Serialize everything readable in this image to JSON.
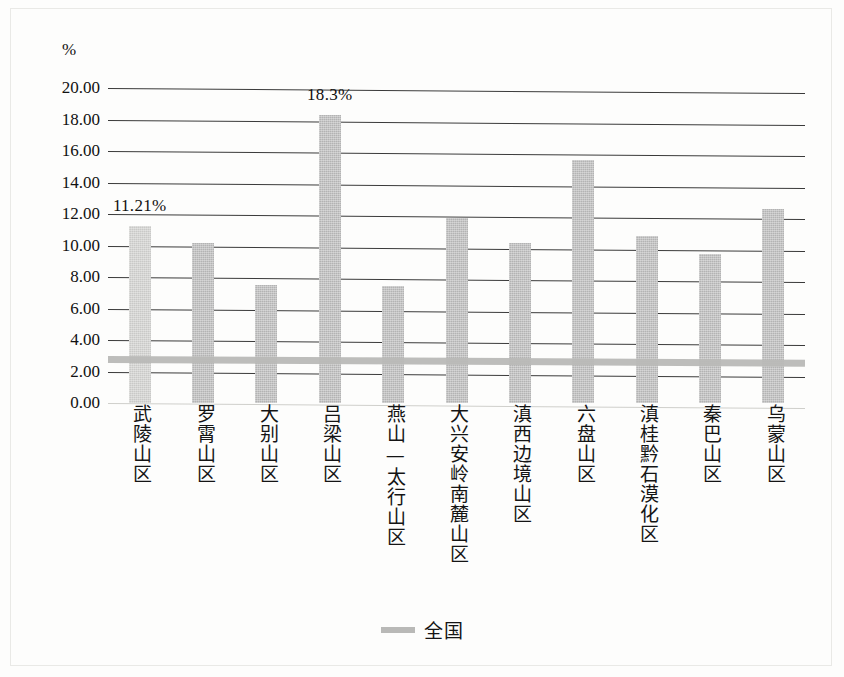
{
  "axis": {
    "unit_label": "%",
    "y_ticks": [
      "20.00",
      "18.00",
      "16.00",
      "14.00",
      "12.00",
      "10.00",
      "8.00",
      "6.00",
      "4.00",
      "2.00",
      "0.00"
    ]
  },
  "legend": {
    "series_label": "全国",
    "swatch": "national-average-line-swatch"
  },
  "annotations": {
    "first_bar_label": "11.21%",
    "tallest_bar_label": "18.3%"
  },
  "colors": {
    "bar_fill": "#b3b3b3",
    "bar_fill_first": "#c9c9c7",
    "gridline": "#3a3a3a",
    "average_line": "#b9b9b7",
    "text": "#111111"
  },
  "chart_data": {
    "type": "bar",
    "title": "",
    "subtitle": "",
    "xlabel": "",
    "ylabel": "%",
    "ylim": [
      0,
      20
    ],
    "ytick_step": 2,
    "grid": true,
    "legend_position": "bottom-center",
    "categories": [
      "武陵山区",
      "罗霄山区",
      "大别山区",
      "吕梁山区",
      "燕山—太行山区",
      "大兴安岭南麓山区",
      "滇西边境山区",
      "六盘山区",
      "滇桂黔石漠化区",
      "秦巴山区",
      "乌蒙山区"
    ],
    "values": [
      11.21,
      10.15,
      7.5,
      18.3,
      7.45,
      11.75,
      10.15,
      15.4,
      10.6,
      9.45,
      12.3
    ],
    "value_labels": [
      "11.21%",
      "",
      "",
      "18.3%",
      "",
      "",
      "",
      "",
      "",
      "",
      ""
    ],
    "series": [
      {
        "name": "片区贫困发生率",
        "values": [
          11.21,
          10.15,
          7.5,
          18.3,
          7.45,
          11.75,
          10.15,
          15.4,
          10.6,
          9.45,
          12.3
        ]
      }
    ],
    "reference_line": {
      "name": "全国",
      "value": 2.8
    }
  }
}
